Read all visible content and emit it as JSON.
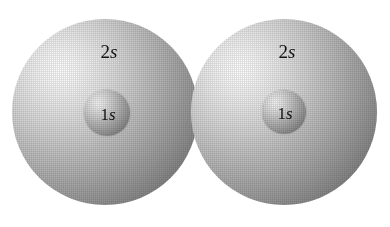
{
  "figure": {
    "background_color": "#ffffff"
  },
  "palette": {
    "sphere_highlight": "#fdfdfd",
    "sphere_midtone": "#b4b4b4",
    "sphere_shadow": "#5c5c5c",
    "core_highlight": "#f2f2f2",
    "core_shadow": "#626262",
    "label_color": "#111111"
  },
  "atoms": [
    {
      "id": "left-atom",
      "outer": {
        "label_number": "2",
        "label_symbol": "s",
        "center_x": 105,
        "center_y": 112,
        "radius": 93
      },
      "inner": {
        "label_number": "1",
        "label_symbol": "s",
        "center_x": 107,
        "center_y": 113,
        "radius": 23
      }
    },
    {
      "id": "right-atom",
      "outer": {
        "label_number": "2",
        "label_symbol": "s",
        "center_x": 284,
        "center_y": 112,
        "radius": 93
      },
      "inner": {
        "label_number": "1",
        "label_symbol": "s",
        "center_x": 284,
        "center_y": 112,
        "radius": 22
      }
    }
  ]
}
